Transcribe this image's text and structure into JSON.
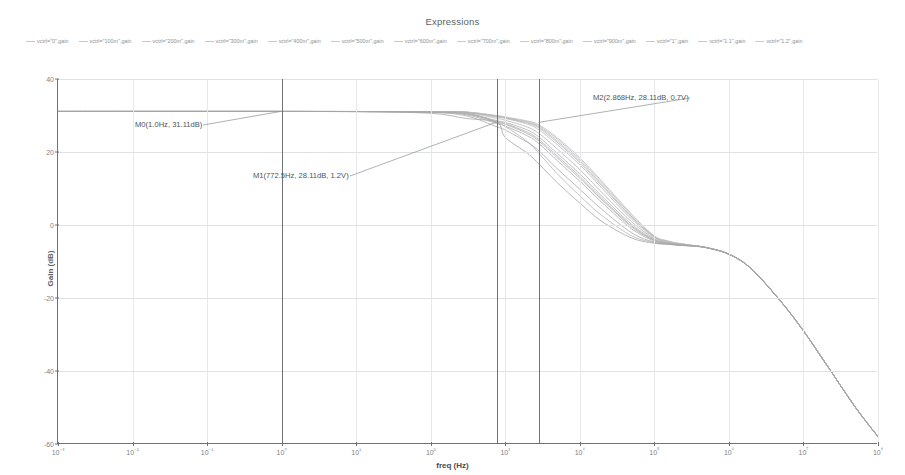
{
  "window": {
    "title": "Expressions"
  },
  "chart_data": {
    "type": "line",
    "title": "Expressions",
    "xlabel": "freq (Hz)",
    "ylabel": "Gain (dB)",
    "xscale": "log",
    "xlim": [
      0.001,
      100000000
    ],
    "ylim": [
      -60,
      40
    ],
    "grid": true,
    "legend_position": "top",
    "xtick_labels": [
      "10⁻³",
      "10⁻²",
      "10⁻¹",
      "10⁰",
      "10¹",
      "10²",
      "10³",
      "10⁴",
      "10⁵",
      "10⁶",
      "10⁷",
      "10⁸"
    ],
    "xtick_values": [
      0.001,
      0.01,
      0.1,
      1,
      10,
      100,
      1000,
      10000,
      100000,
      1000000,
      10000000,
      100000000
    ],
    "ytick_labels": [
      "40",
      "20",
      "0",
      "-20",
      "-40",
      "-60"
    ],
    "ytick_values": [
      40,
      20,
      0,
      -20,
      -40,
      -60
    ],
    "legend": [
      {
        "label": "vctrl=\"0\",gain",
        "color": "#bdbdbd"
      },
      {
        "label": "vctrl=\"100m\",gain",
        "color": "#c3bdbd"
      },
      {
        "label": "vctrl=\"200m\",gain",
        "color": "#bdc3bd"
      },
      {
        "label": "vctrl=\"300m\",gain",
        "color": "#bdbdc3"
      },
      {
        "label": "vctrl=\"400m\",gain",
        "color": "#c6c0ba"
      },
      {
        "label": "vctrl=\"500m\",gain",
        "color": "#bac6c0"
      },
      {
        "label": "vctrl=\"600m\",gain",
        "color": "#c0bac6"
      },
      {
        "label": "vctrl=\"700m\",gain",
        "color": "#c4c4ba"
      },
      {
        "label": "vctrl=\"800m\",gain",
        "color": "#bac4c4"
      },
      {
        "label": "vctrl=\"900m\",gain",
        "color": "#c4bac4"
      },
      {
        "label": "vctrl=\"1\",gain",
        "color": "#bfbfc5"
      },
      {
        "label": "vctrl=\"1.1\",gain",
        "color": "#c5bfbf"
      },
      {
        "label": "vctrl=\"1.2\",gain",
        "color": "#bfc5bf"
      }
    ],
    "annotations": [
      {
        "name": "M0",
        "text": "M0(1.0Hz, 31.11dB)",
        "freq": 1.0,
        "gain": 31.11
      },
      {
        "name": "M1",
        "text": "M1(772.5Hz, 28.11dB, 1.2V)",
        "freq": 772.5,
        "gain": 28.11,
        "vctrl": "1.2V"
      },
      {
        "name": "M2",
        "text": "M2(2.868Hz, 28.11dB, 0.7V)",
        "freq": 2868,
        "gain": 28.11,
        "vctrl": "0.7V"
      }
    ],
    "marker_lines_hz": [
      1,
      772.5,
      2868
    ],
    "series": [
      {
        "name": "vctrl=\"0\",gain",
        "color": "#b4b4b4",
        "x": [
          0.001,
          0.01,
          0.1,
          1,
          10,
          100,
          300,
          772.5,
          1000,
          2000,
          2868,
          5000,
          10000,
          20000,
          50000,
          100000,
          150000,
          200000,
          300000,
          500000,
          1000000,
          2000000,
          5000000,
          10000000,
          20000000,
          50000000,
          100000000
        ],
        "y": [
          31.11,
          31.11,
          31.11,
          31.11,
          31.1,
          31.0,
          30.7,
          28.11,
          27.0,
          22.8,
          19.5,
          14.0,
          8.0,
          2.5,
          -3.0,
          -4.8,
          -5.2,
          -5.4,
          -5.6,
          -6.2,
          -8.0,
          -12.0,
          -21.0,
          -29.0,
          -38.0,
          -50.0,
          -58.0
        ]
      },
      {
        "name": "vctrl=\"100m\",gain",
        "color": "#b8b8b8",
        "x": [
          0.001,
          0.01,
          0.1,
          1,
          10,
          100,
          300,
          772.5,
          1000,
          2000,
          2868,
          5000,
          10000,
          20000,
          50000,
          100000,
          150000,
          200000,
          300000,
          500000,
          1000000,
          2000000,
          5000000,
          10000000,
          20000000,
          50000000,
          100000000
        ],
        "y": [
          31.11,
          31.11,
          31.11,
          31.11,
          31.1,
          31.05,
          30.9,
          29.6,
          29.2,
          27.6,
          26.0,
          22.0,
          16.5,
          10.0,
          1.5,
          -3.4,
          -4.6,
          -5.1,
          -5.5,
          -6.2,
          -8.0,
          -12.0,
          -21.0,
          -29.0,
          -38.0,
          -50.0,
          -58.0
        ]
      },
      {
        "name": "vctrl=\"200m\",gain",
        "color": "#bababa",
        "x": [
          0.001,
          0.01,
          0.1,
          1,
          10,
          100,
          300,
          772.5,
          1000,
          2000,
          2868,
          5000,
          10000,
          20000,
          50000,
          100000,
          150000,
          200000,
          300000,
          500000,
          1000000,
          2000000,
          5000000,
          10000000,
          20000000,
          50000000,
          100000000
        ],
        "y": [
          31.11,
          31.11,
          31.11,
          31.11,
          31.1,
          31.05,
          30.92,
          29.8,
          29.4,
          28.1,
          26.8,
          23.0,
          17.5,
          11.0,
          2.2,
          -3.2,
          -4.5,
          -5.0,
          -5.5,
          -6.2,
          -8.0,
          -12.0,
          -21.0,
          -29.0,
          -38.0,
          -50.0,
          -58.0
        ]
      },
      {
        "name": "vctrl=\"300m\",gain",
        "color": "#bcbcbc",
        "x": [
          0.001,
          0.01,
          0.1,
          1,
          10,
          100,
          300,
          772.5,
          1000,
          2000,
          2868,
          5000,
          10000,
          20000,
          50000,
          100000,
          150000,
          200000,
          300000,
          500000,
          1000000,
          2000000,
          5000000,
          10000000,
          20000000,
          50000000,
          100000000
        ],
        "y": [
          31.11,
          31.11,
          31.11,
          31.11,
          31.1,
          31.05,
          30.93,
          29.9,
          29.5,
          28.3,
          27.1,
          23.5,
          18.0,
          11.5,
          2.6,
          -3.1,
          -4.4,
          -5.0,
          -5.5,
          -6.2,
          -8.0,
          -12.0,
          -21.0,
          -29.0,
          -38.0,
          -50.0,
          -58.0
        ]
      },
      {
        "name": "vctrl=\"400m\",gain",
        "color": "#bebebe",
        "x": [
          0.001,
          0.01,
          0.1,
          1,
          10,
          100,
          300,
          772.5,
          1000,
          2000,
          2868,
          5000,
          10000,
          20000,
          50000,
          100000,
          150000,
          200000,
          300000,
          500000,
          1000000,
          2000000,
          5000000,
          10000000,
          20000000,
          50000000,
          100000000
        ],
        "y": [
          31.11,
          31.11,
          31.11,
          31.11,
          31.1,
          31.05,
          30.94,
          30.0,
          29.6,
          28.5,
          27.4,
          23.9,
          18.4,
          11.9,
          2.9,
          -3.0,
          -4.3,
          -4.9,
          -5.5,
          -6.2,
          -8.0,
          -12.0,
          -21.0,
          -29.0,
          -38.0,
          -50.0,
          -58.0
        ]
      },
      {
        "name": "vctrl=\"500m\",gain",
        "color": "#b6b6b6",
        "x": [
          0.001,
          0.01,
          0.1,
          1,
          10,
          100,
          300,
          772.5,
          1000,
          2000,
          2868,
          5000,
          10000,
          20000,
          50000,
          100000,
          150000,
          200000,
          300000,
          500000,
          1000000,
          2000000,
          5000000,
          10000000,
          20000000,
          50000000,
          100000000
        ],
        "y": [
          31.11,
          31.11,
          31.11,
          31.11,
          31.1,
          31.04,
          30.9,
          29.7,
          29.3,
          27.9,
          26.5,
          22.6,
          17.1,
          10.6,
          2.0,
          -3.3,
          -4.6,
          -5.1,
          -5.5,
          -6.2,
          -8.0,
          -12.0,
          -21.0,
          -29.0,
          -38.0,
          -50.0,
          -58.0
        ]
      },
      {
        "name": "vctrl=\"600m\",gain",
        "color": "#b2b2b2",
        "x": [
          0.001,
          0.01,
          0.1,
          1,
          10,
          100,
          300,
          772.5,
          1000,
          2000,
          2868,
          5000,
          10000,
          20000,
          50000,
          100000,
          150000,
          200000,
          300000,
          500000,
          1000000,
          2000000,
          5000000,
          10000000,
          20000000,
          50000000,
          100000000
        ],
        "y": [
          31.11,
          31.11,
          31.11,
          31.11,
          31.1,
          31.02,
          30.8,
          29.2,
          28.7,
          26.8,
          25.0,
          20.8,
          15.2,
          8.8,
          0.8,
          -3.7,
          -4.8,
          -5.2,
          -5.6,
          -6.2,
          -8.0,
          -12.0,
          -21.0,
          -29.0,
          -38.0,
          -50.0,
          -58.0
        ]
      },
      {
        "name": "vctrl=\"700m\",gain",
        "color": "#aeaeae",
        "x": [
          0.001,
          0.01,
          0.1,
          1,
          10,
          100,
          300,
          772.5,
          1000,
          2000,
          2868,
          5000,
          10000,
          20000,
          50000,
          100000,
          150000,
          200000,
          300000,
          500000,
          1000000,
          2000000,
          5000000,
          10000000,
          20000000,
          50000000,
          100000000
        ],
        "y": [
          31.11,
          31.11,
          31.11,
          31.11,
          31.09,
          31.0,
          30.6,
          28.6,
          28.11,
          26.0,
          24.0,
          19.6,
          14.0,
          7.8,
          0.1,
          -3.9,
          -4.9,
          -5.3,
          -5.6,
          -6.2,
          -8.0,
          -12.0,
          -21.0,
          -29.0,
          -38.0,
          -50.0,
          -58.0
        ]
      },
      {
        "name": "vctrl=\"800m\",gain",
        "color": "#b0b0b0",
        "x": [
          0.001,
          0.01,
          0.1,
          1,
          10,
          100,
          300,
          772.5,
          1000,
          2000,
          2868,
          5000,
          10000,
          20000,
          50000,
          100000,
          150000,
          200000,
          300000,
          500000,
          1000000,
          2000000,
          5000000,
          10000000,
          20000000,
          50000000,
          100000000
        ],
        "y": [
          31.11,
          31.11,
          31.11,
          31.11,
          31.09,
          30.98,
          30.5,
          28.4,
          27.8,
          25.4,
          23.3,
          18.9,
          13.3,
          7.2,
          -0.3,
          -4.1,
          -5.0,
          -5.3,
          -5.6,
          -6.2,
          -8.0,
          -12.0,
          -21.0,
          -29.0,
          -38.0,
          -50.0,
          -58.0
        ]
      },
      {
        "name": "vctrl=\"900m\",gain",
        "color": "#acacac",
        "x": [
          0.001,
          0.01,
          0.1,
          1,
          10,
          100,
          300,
          772.5,
          1000,
          2000,
          2868,
          5000,
          10000,
          20000,
          50000,
          100000,
          150000,
          200000,
          300000,
          500000,
          1000000,
          2000000,
          5000000,
          10000000,
          20000000,
          50000000,
          100000000
        ],
        "y": [
          31.11,
          31.11,
          31.11,
          31.11,
          31.09,
          30.96,
          30.4,
          28.2,
          27.6,
          25.0,
          22.9,
          18.4,
          12.8,
          6.8,
          -0.6,
          -4.2,
          -5.0,
          -5.4,
          -5.6,
          -6.2,
          -8.0,
          -12.0,
          -21.0,
          -29.0,
          -38.0,
          -50.0,
          -58.0
        ]
      },
      {
        "name": "vctrl=\"1\",gain",
        "color": "#aaaaaa",
        "x": [
          0.001,
          0.01,
          0.1,
          1,
          10,
          100,
          300,
          772.5,
          1000,
          2000,
          2868,
          5000,
          10000,
          20000,
          50000,
          100000,
          150000,
          200000,
          300000,
          500000,
          1000000,
          2000000,
          5000000,
          10000000,
          20000000,
          50000000,
          100000000
        ],
        "y": [
          31.11,
          31.11,
          31.11,
          31.11,
          31.08,
          30.92,
          30.2,
          27.8,
          27.1,
          24.4,
          22.2,
          17.6,
          12.0,
          6.1,
          -1.1,
          -4.4,
          -5.1,
          -5.4,
          -5.7,
          -6.2,
          -8.0,
          -12.0,
          -21.0,
          -29.0,
          -38.0,
          -50.0,
          -58.0
        ]
      },
      {
        "name": "vctrl=\"1.1\",gain",
        "color": "#a8a8a8",
        "x": [
          0.001,
          0.01,
          0.1,
          1,
          10,
          100,
          300,
          772.5,
          1000,
          2000,
          2868,
          5000,
          10000,
          20000,
          50000,
          100000,
          150000,
          200000,
          300000,
          500000,
          1000000,
          2000000,
          5000000,
          10000000,
          20000000,
          50000000,
          100000000
        ],
        "y": [
          31.11,
          31.11,
          31.11,
          31.11,
          31.07,
          30.85,
          29.9,
          26.9,
          26.0,
          22.6,
          20.2,
          15.4,
          9.8,
          4.2,
          -2.2,
          -4.7,
          -5.2,
          -5.5,
          -5.7,
          -6.2,
          -8.0,
          -12.0,
          -21.0,
          -29.0,
          -38.0,
          -50.0,
          -58.0
        ]
      },
      {
        "name": "vctrl=\"1.2\",gain",
        "color": "#a4a4a4",
        "x": [
          0.001,
          0.01,
          0.1,
          1,
          10,
          100,
          300,
          772.5,
          1000,
          2000,
          2868,
          5000,
          10000,
          20000,
          50000,
          100000,
          150000,
          200000,
          300000,
          500000,
          1000000,
          2000000,
          5000000,
          10000000,
          20000000,
          50000000,
          100000000
        ],
        "y": [
          31.11,
          31.11,
          31.11,
          31.11,
          31.05,
          30.6,
          29.2,
          28.11,
          24.0,
          19.6,
          16.6,
          11.6,
          6.0,
          0.9,
          -3.6,
          -5.0,
          -5.3,
          -5.5,
          -5.8,
          -6.2,
          -8.0,
          -12.0,
          -21.0,
          -29.0,
          -38.0,
          -50.0,
          -58.0
        ]
      }
    ]
  }
}
